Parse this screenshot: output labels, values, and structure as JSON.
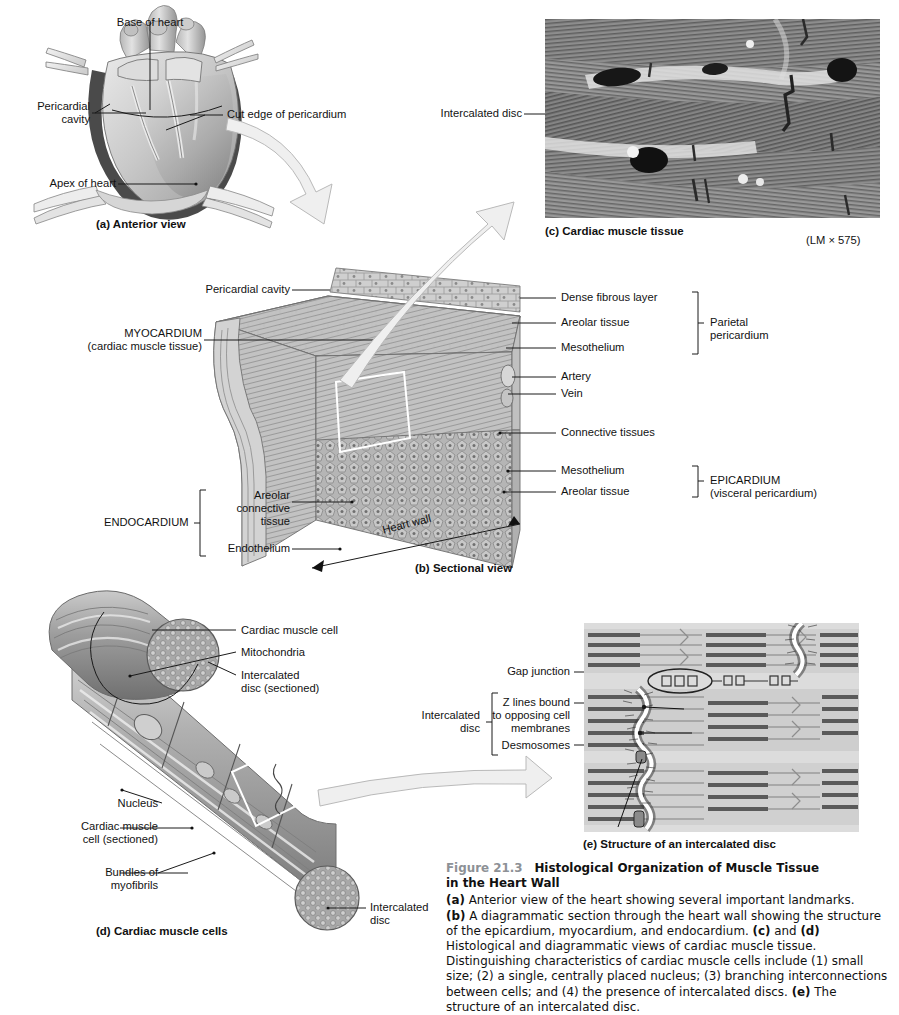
{
  "figure": {
    "number": "Figure 21.3",
    "title_line1": "Histological Organization of Muscle Tissue",
    "title_line2": "in the Heart Wall",
    "caption_parts": [
      {
        "b": "(a)",
        "t": " Anterior view of the heart showing several important landmarks."
      },
      {
        "b": "(b)",
        "t": " A diagrammatic section through the heart wall showing the structure of the epicardium, myocardium, and endocardium. "
      },
      {
        "b": "(c)",
        "t": " and "
      },
      {
        "b": "(d)",
        "t": " Histological and diagrammatic views of cardiac muscle tissue. Distinguishing characteristics of cardiac muscle cells include (1) small size; (2) a single, centrally placed nucleus; (3) branching interconnections between cells; and (4) the presence of intercalated discs. "
      },
      {
        "b": "(e)",
        "t": " The structure of an intercalated disc."
      }
    ],
    "caption_full": "(a) Anterior view of the heart showing several important landmarks. (b) A diagrammatic section through the heart wall showing the structure of the epicardium, myocardium, and endocardium. (c) and (d) Histological and diagrammatic views of cardiac muscle tissue. Distinguishing characteristics of cardiac muscle cells include (1) small size; (2) a single, centrally placed nucleus; (3) branching interconnections between cells; and (4) the presence of intercalated discs. (e) The structure of an intercalated disc."
  },
  "panel_a": {
    "title": "(a) Anterior view",
    "labels": {
      "base_of_heart": "Base of heart",
      "pericardial_cavity": "Pericardial\ncavity",
      "cut_edge": "Cut edge of pericardium",
      "apex_of_heart": "Apex of heart"
    }
  },
  "panel_b": {
    "title": "(b) Sectional view",
    "labels": {
      "pericardial_cavity": "Pericardial cavity",
      "myocardium": "MYOCARDIUM",
      "myocardium_sub": "(cardiac muscle tissue)",
      "dense_fibrous_layer": "Dense fibrous layer",
      "areolar_tissue_1": "Areolar tissue",
      "mesothelium_1": "Mesothelium",
      "parietal_pericardium": "Parietal\npericardium",
      "artery": "Artery",
      "vein": "Vein",
      "connective_tissues": "Connective tissues",
      "mesothelium_2": "Mesothelium",
      "areolar_tissue_2": "Areolar tissue",
      "epicardium": "EPICARDIUM",
      "epicardium_sub": "(visceral pericardium)",
      "endocardium": "ENDOCARDIUM",
      "areolar_connective_tissue": "Areolar\nconnective\ntissue",
      "endothelium": "Endothelium",
      "heart_wall": "Heart wall"
    }
  },
  "panel_c": {
    "title": "(c) Cardiac muscle tissue",
    "magnification": "(LM × 575)",
    "labels": {
      "intercalated_disc": "Intercalated disc"
    }
  },
  "panel_d": {
    "title": "(d) Cardiac muscle cells",
    "labels": {
      "cardiac_muscle_cell": "Cardiac muscle cell",
      "mitochondria": "Mitochondria",
      "intercalated_disc_sectioned": "Intercalated\ndisc (sectioned)",
      "nucleus": "Nucleus",
      "cardiac_muscle_cell_sectioned": "Cardiac muscle\ncell (sectioned)",
      "bundles_of_myofibrils": "Bundles of\nmyofibrils",
      "intercalated_disc": "Intercalated\ndisc"
    }
  },
  "panel_e": {
    "title": "(e) Structure of an intercalated disc",
    "labels": {
      "gap_junction": "Gap junction",
      "z_lines": "Z lines bound\nto opposing cell\nmembranes",
      "desmosomes": "Desmosomes",
      "intercalated_disc": "Intercalated\ndisc"
    }
  },
  "colors": {
    "page_bg": "#ffffff",
    "text": "#111111",
    "leader_line": "#1a1a1a",
    "figure_number": "#8d9196",
    "micrograph_base": "#8f8f8f",
    "diagram_e_base": "#d9d9d9",
    "arrow_fill": "#efefef",
    "arrow_stroke": "#b9b9b9"
  }
}
